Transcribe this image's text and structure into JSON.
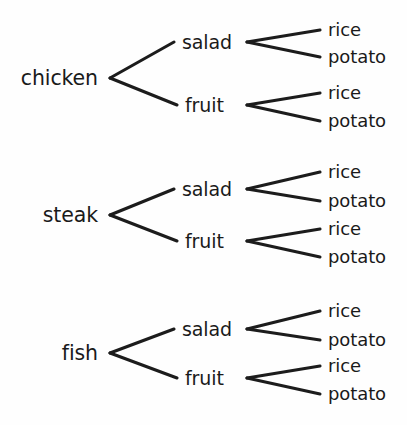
{
  "diagram": {
    "type": "tree-diagram",
    "levels": 3,
    "total_outcomes": 12,
    "line_color": "#1c1c1c",
    "text_color": "#1a1a1a",
    "background_color": "#fefefe",
    "level_names": [
      "main",
      "side",
      "starch"
    ],
    "groups": [
      {
        "root": "chicken",
        "root_x": 98,
        "root_y": 78,
        "vertex_x": 110,
        "children": [
          {
            "label": "salad",
            "label_x": 182,
            "label_y": 42,
            "vertex_x": 247,
            "leaves": [
              {
                "label": "rice",
                "label_x": 328,
                "label_y": 30
              },
              {
                "label": "potato",
                "label_x": 328,
                "label_y": 57
              }
            ]
          },
          {
            "label": "fruit",
            "label_x": 185,
            "label_y": 105,
            "vertex_x": 247,
            "leaves": [
              {
                "label": "rice",
                "label_x": 328,
                "label_y": 93
              },
              {
                "label": "potato",
                "label_x": 328,
                "label_y": 121
              }
            ]
          }
        ]
      },
      {
        "root": "steak",
        "root_x": 98,
        "root_y": 215,
        "vertex_x": 110,
        "children": [
          {
            "label": "salad",
            "label_x": 182,
            "label_y": 189,
            "vertex_x": 247,
            "leaves": [
              {
                "label": "rice",
                "label_x": 328,
                "label_y": 172
              },
              {
                "label": "potato",
                "label_x": 328,
                "label_y": 201
              }
            ]
          },
          {
            "label": "fruit",
            "label_x": 185,
            "label_y": 241,
            "vertex_x": 247,
            "leaves": [
              {
                "label": "rice",
                "label_x": 328,
                "label_y": 229
              },
              {
                "label": "potato",
                "label_x": 328,
                "label_y": 257
              }
            ]
          }
        ]
      },
      {
        "root": "fish",
        "root_x": 98,
        "root_y": 353,
        "vertex_x": 110,
        "children": [
          {
            "label": "salad",
            "label_x": 182,
            "label_y": 329,
            "vertex_x": 247,
            "leaves": [
              {
                "label": "rice",
                "label_x": 328,
                "label_y": 311
              },
              {
                "label": "potato",
                "label_x": 328,
                "label_y": 340
              }
            ]
          },
          {
            "label": "fruit",
            "label_x": 185,
            "label_y": 378,
            "vertex_x": 247,
            "leaves": [
              {
                "label": "rice",
                "label_x": 328,
                "label_y": 366
              },
              {
                "label": "potato",
                "label_x": 328,
                "label_y": 394
              }
            ]
          }
        ]
      }
    ],
    "outcomes": [
      [
        "chicken",
        "salad",
        "rice"
      ],
      [
        "chicken",
        "salad",
        "potato"
      ],
      [
        "chicken",
        "fruit",
        "rice"
      ],
      [
        "chicken",
        "fruit",
        "potato"
      ],
      [
        "steak",
        "salad",
        "rice"
      ],
      [
        "steak",
        "salad",
        "potato"
      ],
      [
        "steak",
        "fruit",
        "rice"
      ],
      [
        "steak",
        "fruit",
        "potato"
      ],
      [
        "fish",
        "salad",
        "rice"
      ],
      [
        "fish",
        "salad",
        "potato"
      ],
      [
        "fish",
        "fruit",
        "rice"
      ],
      [
        "fish",
        "fruit",
        "potato"
      ]
    ]
  }
}
